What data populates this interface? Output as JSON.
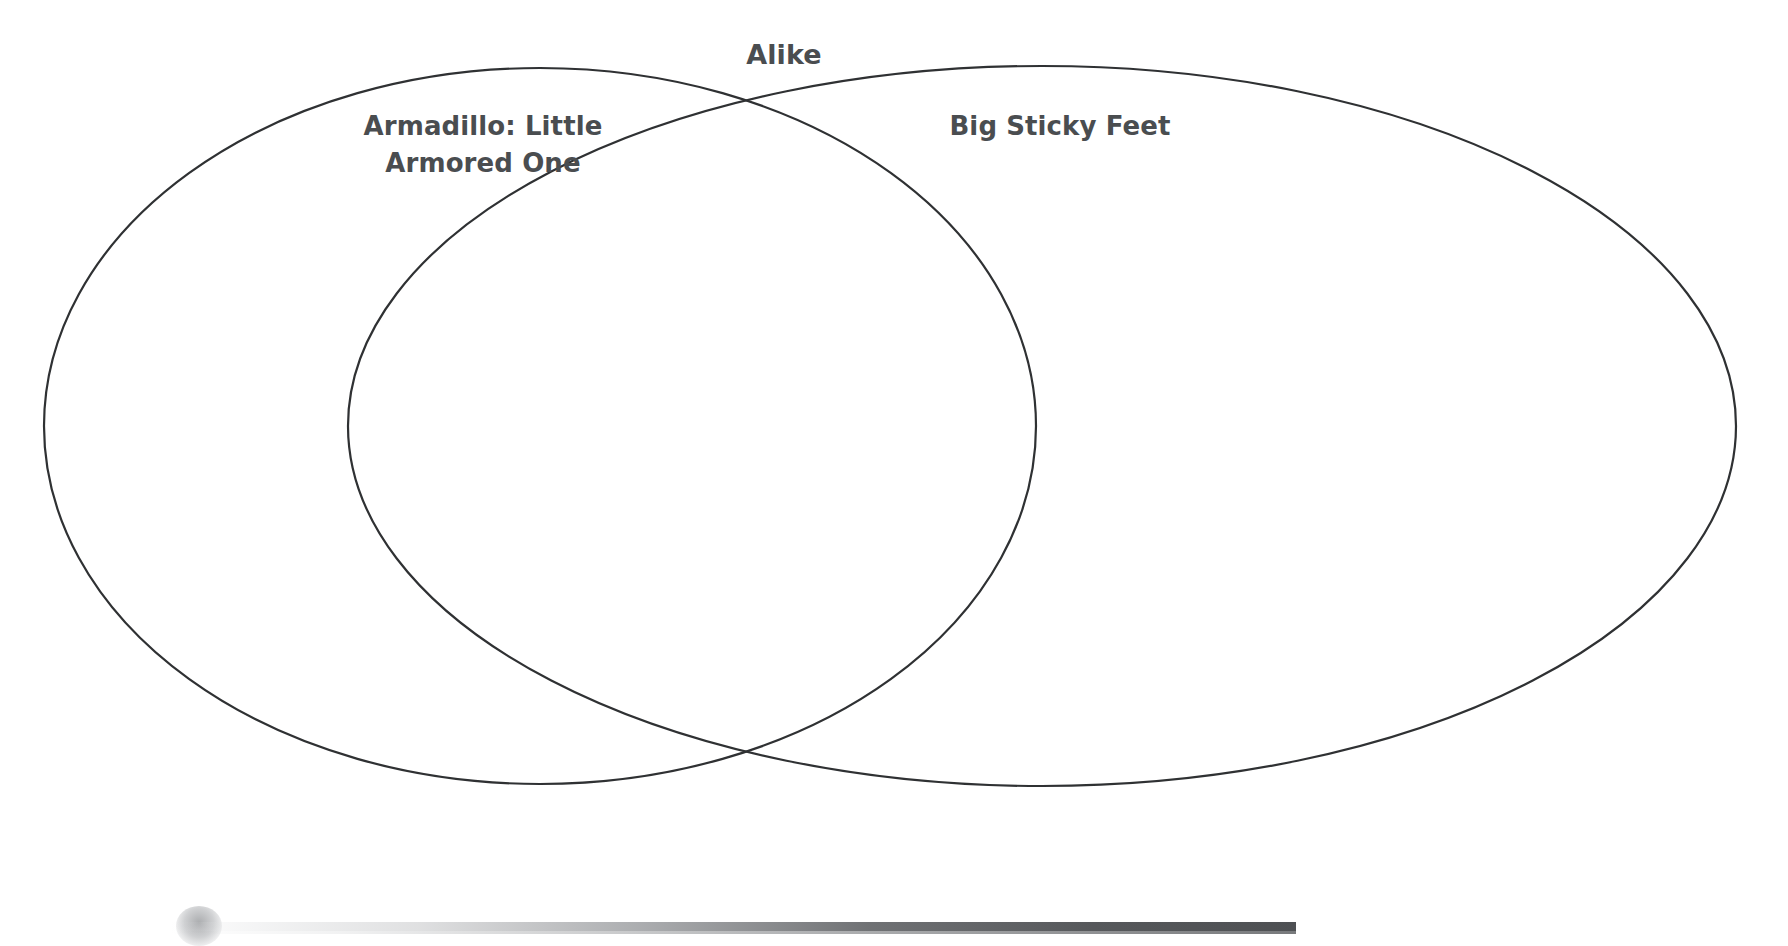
{
  "document": {
    "type": "venn-diagram-worksheet",
    "background_color": "#ffffff",
    "stroke_color": "#2f3133",
    "text_color": "#4a4d50"
  },
  "diagram": {
    "overlap_label": "Alike",
    "left_circle": {
      "label": "Armadillo: Little\nArmored One",
      "label_line_1": "Armadillo: Little",
      "label_line_2": "Armored One",
      "entries": []
    },
    "right_circle": {
      "label": "Big Sticky Feet",
      "label_line_1": "Big Sticky Feet",
      "entries": []
    },
    "intersection": {
      "entries": []
    }
  },
  "artifacts": {
    "smudge": "scan-smudge",
    "scanline": "scan-edge-bar"
  }
}
